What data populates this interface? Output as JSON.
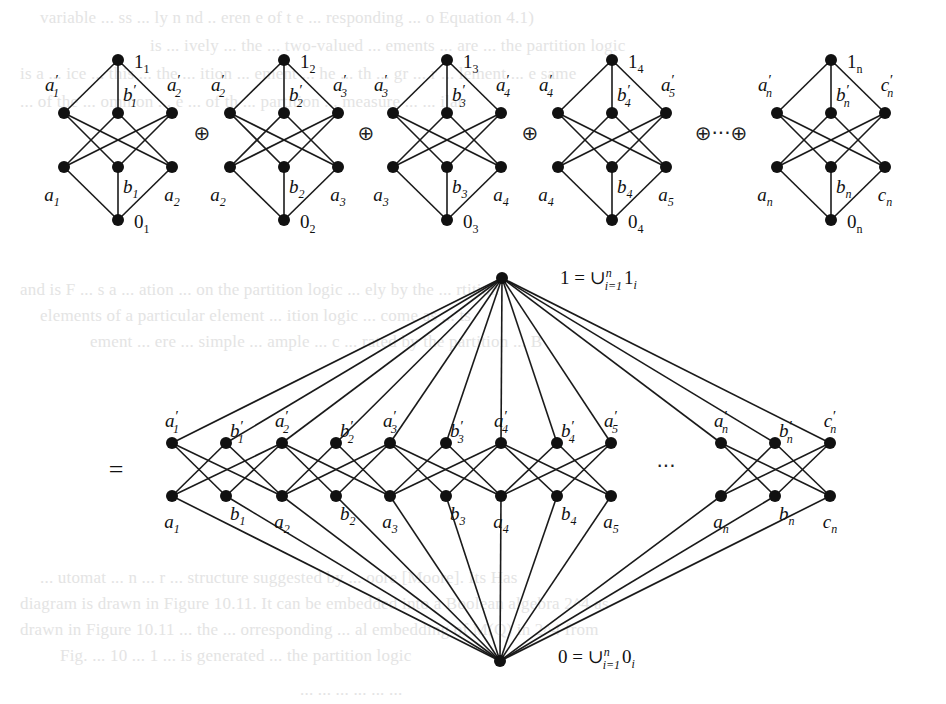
{
  "figure": {
    "type": "lattice-decomposition",
    "top_row": {
      "lattices": [
        {
          "id": "L1",
          "cx": 118,
          "top": {
            "base": "1",
            "sub": "1"
          },
          "upper": [
            {
              "base": "a",
              "prime": true,
              "sub": "1"
            },
            {
              "base": "b",
              "prime": true,
              "sub": "1"
            },
            {
              "base": "a",
              "prime": true,
              "sub": "2"
            }
          ],
          "lower": [
            {
              "base": "a",
              "prime": false,
              "sub": "1"
            },
            {
              "base": "b",
              "prime": false,
              "sub": "1"
            },
            {
              "base": "a",
              "prime": false,
              "sub": "2"
            }
          ],
          "bottom": {
            "base": "0",
            "sub": "1"
          }
        },
        {
          "id": "L2",
          "cx": 284,
          "top": {
            "base": "1",
            "sub": "2"
          },
          "upper": [
            {
              "base": "a",
              "prime": true,
              "sub": "2"
            },
            {
              "base": "b",
              "prime": true,
              "sub": "2"
            },
            {
              "base": "a",
              "prime": true,
              "sub": "3"
            }
          ],
          "lower": [
            {
              "base": "a",
              "prime": false,
              "sub": "2"
            },
            {
              "base": "b",
              "prime": false,
              "sub": "2"
            },
            {
              "base": "a",
              "prime": false,
              "sub": "3"
            }
          ],
          "bottom": {
            "base": "0",
            "sub": "2"
          }
        },
        {
          "id": "L3",
          "cx": 447,
          "top": {
            "base": "1",
            "sub": "3"
          },
          "upper": [
            {
              "base": "a",
              "prime": true,
              "sub": "3"
            },
            {
              "base": "b",
              "prime": true,
              "sub": "3"
            },
            {
              "base": "a",
              "prime": true,
              "sub": "4"
            }
          ],
          "lower": [
            {
              "base": "a",
              "prime": false,
              "sub": "3"
            },
            {
              "base": "b",
              "prime": false,
              "sub": "3"
            },
            {
              "base": "a",
              "prime": false,
              "sub": "4"
            }
          ],
          "bottom": {
            "base": "0",
            "sub": "3"
          }
        },
        {
          "id": "L4",
          "cx": 612,
          "top": {
            "base": "1",
            "sub": "4"
          },
          "upper": [
            {
              "base": "a",
              "prime": true,
              "sub": "4"
            },
            {
              "base": "b",
              "prime": true,
              "sub": "4"
            },
            {
              "base": "a",
              "prime": true,
              "sub": "5"
            }
          ],
          "lower": [
            {
              "base": "a",
              "prime": false,
              "sub": "4"
            },
            {
              "base": "b",
              "prime": false,
              "sub": "4"
            },
            {
              "base": "a",
              "prime": false,
              "sub": "5"
            }
          ],
          "bottom": {
            "base": "0",
            "sub": "4"
          }
        },
        {
          "id": "Ln",
          "cx": 831,
          "top": {
            "base": "1",
            "sub": "n"
          },
          "upper": [
            {
              "base": "a",
              "prime": true,
              "sub": "n"
            },
            {
              "base": "b",
              "prime": true,
              "sub": "n"
            },
            {
              "base": "c",
              "prime": true,
              "sub": "n"
            }
          ],
          "lower": [
            {
              "base": "a",
              "prime": false,
              "sub": "n"
            },
            {
              "base": "b",
              "prime": false,
              "sub": "n"
            },
            {
              "base": "c",
              "prime": false,
              "sub": "n"
            }
          ],
          "bottom": {
            "base": "0",
            "sub": "n"
          }
        }
      ],
      "operators": [
        {
          "text": "⊕",
          "x": 202,
          "y": 140
        },
        {
          "text": "⊕",
          "x": 366,
          "y": 140
        },
        {
          "text": "⊕",
          "x": 530,
          "y": 140
        },
        {
          "text": "⊕···⊕",
          "x": 721,
          "y": 140
        }
      ]
    },
    "equals_sign": "=",
    "combined": {
      "top_node": {
        "x": 502,
        "y": 278,
        "label": "1 = ∪",
        "sup": "n",
        "sub": "i=1",
        "tail": "1",
        "tail_sub": "i"
      },
      "bottom_node": {
        "x": 500,
        "y": 661,
        "label": "0 = ∪",
        "sup": "n",
        "sub": "i=1",
        "tail": "0",
        "tail_sub": "i"
      },
      "upper_row_y": 443,
      "lower_row_y": 496,
      "ellipsis": "···",
      "upper": [
        {
          "x": 172,
          "base": "a",
          "sub": "1"
        },
        {
          "x": 226,
          "base": "b",
          "sub": "1"
        },
        {
          "x": 282,
          "base": "a",
          "sub": "2"
        },
        {
          "x": 336,
          "base": "b",
          "sub": "2"
        },
        {
          "x": 390,
          "base": "a",
          "sub": "3"
        },
        {
          "x": 446,
          "base": "b",
          "sub": "3"
        },
        {
          "x": 501,
          "base": "a",
          "sub": "4"
        },
        {
          "x": 557,
          "base": "b",
          "sub": "4"
        },
        {
          "x": 611,
          "base": "a",
          "sub": "5"
        },
        {
          "x": 721,
          "base": "a",
          "sub": "n"
        },
        {
          "x": 775,
          "base": "b",
          "sub": "n"
        },
        {
          "x": 830,
          "base": "c",
          "sub": "n"
        }
      ],
      "groups": [
        [
          0,
          1,
          2
        ],
        [
          2,
          3,
          4
        ],
        [
          4,
          5,
          6
        ],
        [
          6,
          7,
          8
        ],
        [
          9,
          10,
          11
        ]
      ]
    }
  },
  "background_bleed": [
    {
      "y": 18,
      "x": 40,
      "text": "variable ... ss ... ly n nd .. eren e of t e ... responding ... o Equation 4.1)"
    },
    {
      "y": 46,
      "x": 150,
      "text": "is ... ively ... the ... two-valued ... ements ... are ... the partition logic"
    },
    {
      "y": 74,
      "x": 20,
      "text": "is a ... ice ... this ... the ... ition ... ement ... he ... th ... gr ... r ... lement ... e same"
    },
    {
      "y": 102,
      "x": 20,
      "text": "... of the ... ommon ... e ... of th ... partition ... measure ... ... ilar"
    },
    {
      "y": 290,
      "x": 20,
      "text": "and is F ... s a ... ation ... on the partition logic ... ely by the ... rtition"
    },
    {
      "y": 316,
      "x": 40,
      "text": "elements of a particular element ... ition logic ... come as ... ts"
    },
    {
      "y": 342,
      "x": 90,
      "text": "ement ... ere ... simple ... ample ... c ... rated by the partition ... B"
    },
    {
      "y": 578,
      "x": 40,
      "text": "... utomat ... n ... r ... structure suggested by ... oore [Moore]. Its Has"
    },
    {
      "y": 604,
      "x": 20,
      "text": "diagram is drawn in Figure 10.11. It can be embedded into a Boolean algebra 2^4 as"
    },
    {
      "y": 630,
      "x": 20,
      "text": "drawn in Figure 10.11 ... the ... orresponding ... al embedding of M(Q) in 2^4 from"
    },
    {
      "y": 656,
      "x": 60,
      "text": "Fig. ... 10 ... 1 ... is generated ... the partition logic"
    },
    {
      "y": 690,
      "x": 300,
      "text": "... ... ... ... ... ..."
    }
  ]
}
